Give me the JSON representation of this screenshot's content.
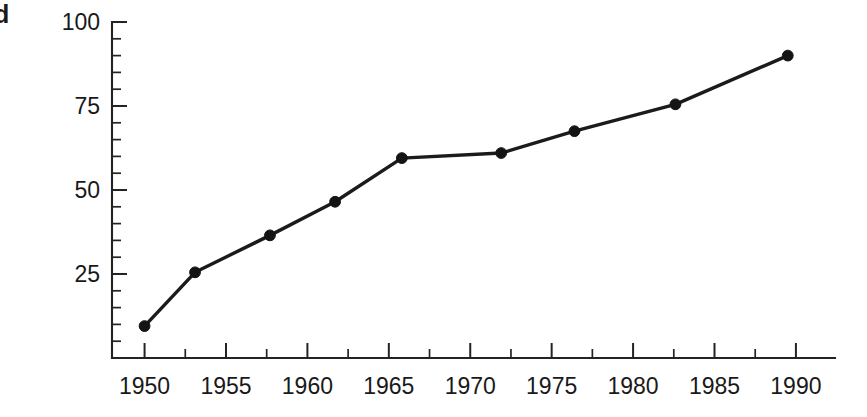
{
  "margin_glyph": "d",
  "chart_data": {
    "type": "line",
    "title": "",
    "xlabel": "",
    "ylabel": "World fish catch (in mmt)",
    "xlim": [
      1948.0,
      1992.4
    ],
    "ylim": [
      0,
      100
    ],
    "grid": false,
    "legend": null,
    "x_ticks": [
      1950,
      1955,
      1960,
      1965,
      1970,
      1975,
      1980,
      1985,
      1990
    ],
    "x_tick_labels": [
      "1950",
      "1955",
      "1960",
      "1965",
      "1970",
      "1975",
      "1980",
      "1985",
      "1990"
    ],
    "x_minor_tick_step": 2.5,
    "y_ticks": [
      25,
      50,
      75,
      100
    ],
    "y_tick_labels": [
      "25",
      "50",
      "75",
      "100"
    ],
    "y_minor_tick_step": 5,
    "marker": "filled-circle",
    "x": [
      1950.0,
      1953.1,
      1957.7,
      1961.7,
      1965.8,
      1971.9,
      1976.4,
      1982.6,
      1989.5
    ],
    "values": [
      9.5,
      25.5,
      36.5,
      46.5,
      59.5,
      61.0,
      67.5,
      75.5,
      90.0
    ],
    "points": [
      {
        "x": 1950.0,
        "y": 9.5
      },
      {
        "x": 1953.1,
        "y": 25.5
      },
      {
        "x": 1957.7,
        "y": 36.5
      },
      {
        "x": 1961.7,
        "y": 46.5
      },
      {
        "x": 1965.8,
        "y": 59.5
      },
      {
        "x": 1971.9,
        "y": 61.0
      },
      {
        "x": 1976.4,
        "y": 67.5
      },
      {
        "x": 1982.6,
        "y": 75.5
      },
      {
        "x": 1989.5,
        "y": 90.0
      }
    ],
    "colors": {
      "line": "#1b1b1b",
      "marker": "#141414",
      "axis": "#232323",
      "text": "#191919",
      "background": "#ffffff"
    }
  }
}
